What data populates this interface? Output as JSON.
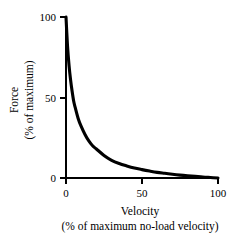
{
  "chart_data": {
    "type": "line",
    "title": "",
    "xlabel": "Velocity",
    "xlabel_sub": "(% of maximum no-load velocity)",
    "ylabel": "Force",
    "ylabel_sub": "(% of maximum)",
    "xlim": [
      0,
      100
    ],
    "ylim": [
      0,
      100
    ],
    "xticks": [
      0,
      50,
      100
    ],
    "yticks": [
      0,
      50,
      100
    ],
    "xticklabels": [
      "0",
      "50",
      "100"
    ],
    "yticklabels": [
      "0",
      "50",
      "100"
    ],
    "grid": false,
    "legend": false,
    "series": [
      {
        "name": "force-velocity",
        "color": "#000000",
        "x": [
          0,
          1,
          2,
          3,
          4,
          5,
          6,
          8,
          10,
          12.5,
          15,
          17.5,
          20,
          25,
          30,
          35,
          40,
          45,
          50,
          55,
          60,
          65,
          70,
          75,
          80,
          85,
          90,
          95,
          100
        ],
        "y": [
          100,
          82,
          70,
          61,
          54,
          48,
          44,
          37,
          32,
          27,
          23,
          20,
          18,
          14,
          11,
          9,
          7.5,
          6.2,
          5.2,
          4.3,
          3.5,
          2.9,
          2.3,
          1.8,
          1.4,
          1.0,
          0.6,
          0.3,
          0
        ]
      }
    ]
  },
  "axes": {
    "y_tick_top": "100",
    "y_tick_mid": "50",
    "y_tick_bottom": "0",
    "x_tick_left": "0",
    "x_tick_mid": "50",
    "x_tick_right": "100"
  },
  "colors": {
    "background": "#ffffff",
    "axis": "#000000",
    "curve": "#000000"
  }
}
